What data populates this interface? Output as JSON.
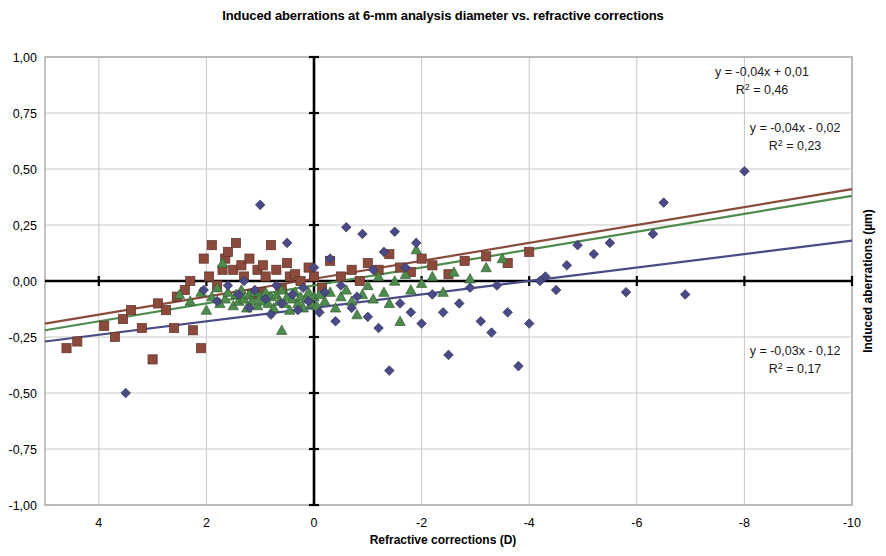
{
  "title": "Induced aberrations at 6-mm analysis diameter vs. refractive corrections",
  "axes": {
    "xlabel": "Refractive corrections (D)",
    "ylabel": "Induced aberrations (µm)",
    "x_ticks": [
      "4",
      "2",
      "0",
      "-2",
      "-4",
      "-6",
      "-8",
      "-10"
    ],
    "y_ticks": [
      "1,00",
      "0,75",
      "0,50",
      "0,25",
      "0,00",
      "-0,25",
      "-0,50",
      "-0,75",
      "-1,00"
    ]
  },
  "annotations": {
    "eq1_line1": "y = -0,04x + 0,01",
    "eq1_r2_pre": "R",
    "eq1_r2_sup": "2",
    "eq1_r2_post": " = 0,46",
    "eq2_line1": "y = -0,04x - 0,02",
    "eq2_r2_pre": "R",
    "eq2_r2_sup": "2",
    "eq2_r2_post": " = 0,23",
    "eq3_line1": "y = -0,03x - 0,12",
    "eq3_r2_pre": "R",
    "eq3_r2_sup": "2",
    "eq3_r2_post": " = 0,17"
  },
  "colors": {
    "series_square": "#8B4A3C",
    "series_triangle": "#4E8B4E",
    "series_diamond": "#4A4A86",
    "gridline": "#c8c8c8",
    "axis": "#000000",
    "frame": "#a8a8a8"
  },
  "chart_data": {
    "type": "scatter",
    "title": "Induced aberrations at 6-mm analysis diameter vs. refractive corrections",
    "xlabel": "Refractive corrections (D)",
    "ylabel": "Induced aberrations (µm)",
    "xlim": [
      5,
      -10
    ],
    "ylim": [
      -1.0,
      1.0
    ],
    "x_ticks": [
      4,
      2,
      0,
      -2,
      -4,
      -6,
      -8,
      -10
    ],
    "y_ticks": [
      1.0,
      0.75,
      0.5,
      0.25,
      0.0,
      -0.25,
      -0.5,
      -0.75,
      -1.0
    ],
    "x_axis_reversed": true,
    "grid": true,
    "legend": "none",
    "series": [
      {
        "name": "squares",
        "marker": "square",
        "color": "#8B4A3C",
        "trendline": {
          "slope": -0.04,
          "intercept": 0.01,
          "r2": 0.46,
          "equation": "y = -0,04x + 0,01",
          "color": "#8B4A3C"
        },
        "points": [
          [
            4.6,
            -0.3
          ],
          [
            4.4,
            -0.27
          ],
          [
            3.9,
            -0.2
          ],
          [
            3.7,
            -0.25
          ],
          [
            3.55,
            -0.17
          ],
          [
            3.4,
            -0.13
          ],
          [
            3.2,
            -0.21
          ],
          [
            3.0,
            -0.35
          ],
          [
            2.9,
            -0.1
          ],
          [
            2.75,
            -0.13
          ],
          [
            2.6,
            -0.21
          ],
          [
            2.55,
            -0.07
          ],
          [
            2.4,
            -0.04
          ],
          [
            2.3,
            0.0
          ],
          [
            2.25,
            -0.22
          ],
          [
            2.1,
            -0.3
          ],
          [
            2.05,
            0.1
          ],
          [
            1.95,
            0.02
          ],
          [
            1.9,
            0.16
          ],
          [
            1.8,
            -0.02
          ],
          [
            1.7,
            0.05
          ],
          [
            1.65,
            0.1
          ],
          [
            1.6,
            0.13
          ],
          [
            1.5,
            0.05
          ],
          [
            1.45,
            0.17
          ],
          [
            1.35,
            0.07
          ],
          [
            1.3,
            0.02
          ],
          [
            1.2,
            0.1
          ],
          [
            1.15,
            -0.06
          ],
          [
            1.05,
            0.05
          ],
          [
            1.0,
            -0.05
          ],
          [
            0.95,
            0.07
          ],
          [
            0.9,
            0.02
          ],
          [
            0.8,
            0.16
          ],
          [
            0.7,
            0.05
          ],
          [
            0.6,
            -0.03
          ],
          [
            0.5,
            0.08
          ],
          [
            0.45,
            0.02
          ],
          [
            0.35,
            0.03
          ],
          [
            0.25,
            0.0
          ],
          [
            0.1,
            0.06
          ],
          [
            0.0,
            0.02
          ],
          [
            -0.15,
            -0.03
          ],
          [
            -0.3,
            0.09
          ],
          [
            -0.5,
            0.02
          ],
          [
            -0.7,
            0.05
          ],
          [
            -0.85,
            0.0
          ],
          [
            -1.0,
            0.08
          ],
          [
            -1.2,
            0.05
          ],
          [
            -1.4,
            0.12
          ],
          [
            -1.6,
            0.06
          ],
          [
            -1.8,
            0.04
          ],
          [
            -2.0,
            0.1
          ],
          [
            -2.2,
            0.07
          ],
          [
            -2.5,
            0.03
          ],
          [
            -2.8,
            0.09
          ],
          [
            -3.2,
            0.11
          ],
          [
            -3.6,
            0.08
          ],
          [
            -4.0,
            0.13
          ]
        ]
      },
      {
        "name": "triangles",
        "marker": "triangle",
        "color": "#4E8B4E",
        "trendline": {
          "slope": -0.04,
          "intercept": -0.02,
          "r2": 0.23,
          "equation": "y = -0,04x - 0,02",
          "color": "#4E8B4E"
        },
        "points": [
          [
            2.5,
            -0.06
          ],
          [
            2.3,
            -0.09
          ],
          [
            2.1,
            -0.05
          ],
          [
            2.0,
            -0.13
          ],
          [
            1.9,
            -0.07
          ],
          [
            1.8,
            -0.03
          ],
          [
            1.75,
            -0.1
          ],
          [
            1.65,
            -0.08
          ],
          [
            1.6,
            -0.05
          ],
          [
            1.5,
            -0.11
          ],
          [
            1.45,
            -0.06
          ],
          [
            1.4,
            -0.09
          ],
          [
            1.35,
            -0.04
          ],
          [
            1.3,
            -0.08
          ],
          [
            1.25,
            -0.12
          ],
          [
            1.2,
            -0.06
          ],
          [
            1.15,
            -0.09
          ],
          [
            1.1,
            -0.05
          ],
          [
            1.05,
            -0.11
          ],
          [
            1.0,
            -0.07
          ],
          [
            0.95,
            -0.09
          ],
          [
            0.9,
            -0.05
          ],
          [
            0.85,
            -0.1
          ],
          [
            0.8,
            -0.07
          ],
          [
            0.75,
            -0.12
          ],
          [
            0.7,
            -0.06
          ],
          [
            0.65,
            -0.09
          ],
          [
            0.6,
            -0.04
          ],
          [
            0.55,
            -0.1
          ],
          [
            0.5,
            -0.07
          ],
          [
            0.45,
            -0.13
          ],
          [
            0.4,
            -0.08
          ],
          [
            0.35,
            -0.05
          ],
          [
            0.3,
            -0.1
          ],
          [
            0.25,
            -0.07
          ],
          [
            0.2,
            -0.12
          ],
          [
            0.15,
            -0.08
          ],
          [
            0.1,
            -0.05
          ],
          [
            0.05,
            -0.1
          ],
          [
            0.0,
            -0.07
          ],
          [
            -0.05,
            -0.11
          ],
          [
            -0.1,
            -0.06
          ],
          [
            -0.2,
            -0.09
          ],
          [
            -0.3,
            -0.05
          ],
          [
            -0.4,
            -0.12
          ],
          [
            -0.5,
            -0.07
          ],
          [
            -0.6,
            -0.04
          ],
          [
            -0.7,
            -0.09
          ],
          [
            -0.8,
            -0.15
          ],
          [
            -0.9,
            -0.06
          ],
          [
            -1.0,
            -0.02
          ],
          [
            -1.1,
            -0.08
          ],
          [
            -1.2,
            0.02
          ],
          [
            -1.3,
            -0.05
          ],
          [
            -1.4,
            -0.1
          ],
          [
            -1.5,
            0.0
          ],
          [
            -1.6,
            -0.18
          ],
          [
            -1.7,
            0.03
          ],
          [
            -1.8,
            -0.04
          ],
          [
            -1.9,
            0.14
          ],
          [
            -2.0,
            -0.01
          ],
          [
            -2.2,
            0.02
          ],
          [
            -2.4,
            -0.05
          ],
          [
            -2.6,
            0.04
          ],
          [
            -2.9,
            0.01
          ],
          [
            -3.2,
            0.06
          ],
          [
            -3.5,
            0.1
          ],
          [
            0.6,
            -0.22
          ],
          [
            1.7,
            0.08
          ]
        ]
      },
      {
        "name": "diamonds",
        "marker": "diamond",
        "color": "#4A4A86",
        "trendline": {
          "slope": -0.03,
          "intercept": -0.12,
          "r2": 0.17,
          "equation": "y = -0,03x - 0,12",
          "color": "#4A4A86"
        },
        "points": [
          [
            3.5,
            -0.5
          ],
          [
            2.05,
            -0.04
          ],
          [
            1.8,
            -0.09
          ],
          [
            1.6,
            -0.02
          ],
          [
            1.4,
            -0.06
          ],
          [
            1.3,
            0.0
          ],
          [
            1.2,
            -0.12
          ],
          [
            1.1,
            -0.04
          ],
          [
            1.0,
            0.34
          ],
          [
            0.9,
            -0.08
          ],
          [
            0.8,
            -0.15
          ],
          [
            0.7,
            -0.02
          ],
          [
            0.6,
            -0.1
          ],
          [
            0.5,
            0.17
          ],
          [
            0.4,
            -0.06
          ],
          [
            0.3,
            -0.13
          ],
          [
            0.2,
            -0.03
          ],
          [
            0.1,
            -0.09
          ],
          [
            0.0,
            0.06
          ],
          [
            -0.1,
            -0.14
          ],
          [
            -0.2,
            -0.05
          ],
          [
            -0.3,
            0.1
          ],
          [
            -0.4,
            -0.18
          ],
          [
            -0.5,
            -0.02
          ],
          [
            -0.6,
            0.24
          ],
          [
            -0.7,
            -0.12
          ],
          [
            -0.8,
            -0.07
          ],
          [
            -0.9,
            0.21
          ],
          [
            -1.0,
            -0.16
          ],
          [
            -1.1,
            0.05
          ],
          [
            -1.2,
            -0.21
          ],
          [
            -1.3,
            0.13
          ],
          [
            -1.4,
            -0.4
          ],
          [
            -1.5,
            0.22
          ],
          [
            -1.6,
            -0.1
          ],
          [
            -1.7,
            0.06
          ],
          [
            -1.8,
            -0.14
          ],
          [
            -1.9,
            0.17
          ],
          [
            -2.0,
            -0.19
          ],
          [
            -2.2,
            -0.06
          ],
          [
            -2.4,
            -0.14
          ],
          [
            -2.5,
            -0.33
          ],
          [
            -2.7,
            -0.1
          ],
          [
            -2.9,
            -0.03
          ],
          [
            -3.1,
            -0.18
          ],
          [
            -3.3,
            -0.23
          ],
          [
            -3.4,
            -0.02
          ],
          [
            -3.6,
            -0.14
          ],
          [
            -3.8,
            -0.38
          ],
          [
            -4.0,
            -0.19
          ],
          [
            -4.2,
            0.0
          ],
          [
            -4.3,
            0.02
          ],
          [
            -4.5,
            -0.04
          ],
          [
            -4.7,
            0.07
          ],
          [
            -4.9,
            0.16
          ],
          [
            -5.2,
            0.12
          ],
          [
            -5.5,
            0.17
          ],
          [
            -5.8,
            -0.05
          ],
          [
            -6.3,
            0.21
          ],
          [
            -6.5,
            0.35
          ],
          [
            -6.9,
            -0.06
          ],
          [
            -8.0,
            0.49
          ]
        ]
      }
    ]
  }
}
